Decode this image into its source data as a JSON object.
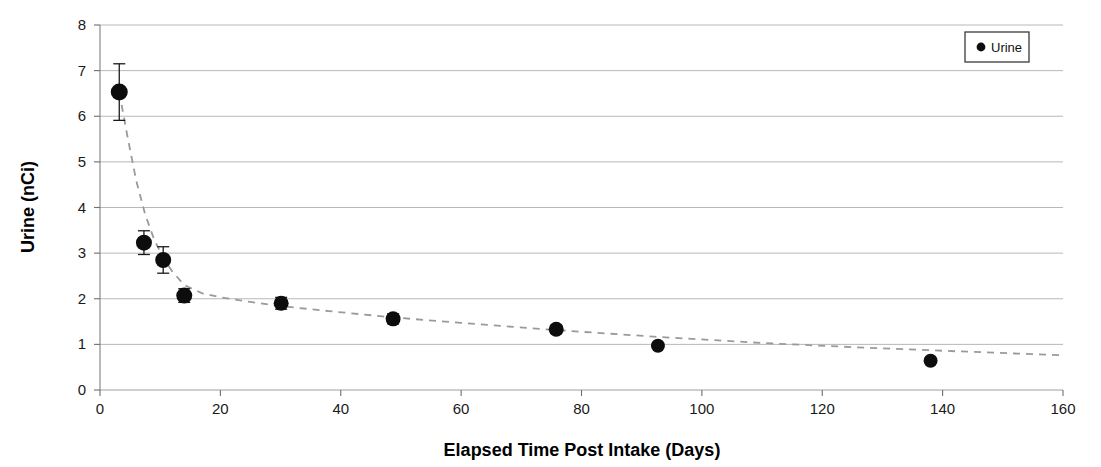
{
  "chart_data": {
    "type": "scatter",
    "title": "",
    "xlabel": "Elapsed Time Post Intake (Days)",
    "ylabel": "Urine  (nCi)",
    "xlim": [
      0,
      160
    ],
    "ylim": [
      0,
      8
    ],
    "xticks": [
      0,
      20,
      40,
      60,
      80,
      100,
      120,
      140,
      160
    ],
    "yticks": [
      0,
      1,
      2,
      3,
      4,
      5,
      6,
      7,
      8
    ],
    "xtick_labels": [
      "0",
      "20",
      "40",
      "60",
      "80",
      "100",
      "120",
      "140",
      "160"
    ],
    "ytick_labels": [
      "0",
      "1",
      "2",
      "3",
      "4",
      "5",
      "6",
      "7",
      "8"
    ],
    "grid": "horizontal",
    "grid_color": "#b0b0b0",
    "legend": {
      "position": "top-right",
      "entries": [
        {
          "name": "Urine",
          "marker": "filled-circle",
          "color": "#0d0d0d"
        }
      ]
    },
    "series": [
      {
        "name": "Urine",
        "marker": "filled-circle",
        "color": "#0d0d0d",
        "x": [
          3.2,
          7.3,
          10.5,
          14.0,
          30.1,
          48.7,
          75.8,
          92.7,
          138.0
        ],
        "y": [
          6.53,
          3.23,
          2.85,
          2.07,
          1.9,
          1.56,
          1.33,
          0.97,
          0.64
        ],
        "yerr": [
          0.62,
          0.26,
          0.29,
          0.15,
          0.13,
          0.11,
          0.09,
          0.05,
          0.04
        ]
      }
    ],
    "trendline": {
      "style": "dashed",
      "color": "#9a9a9a",
      "x": [
        3.2,
        4.5,
        6.0,
        7.5,
        9.0,
        10.5,
        12.0,
        14.0,
        17.0,
        20.0,
        25.0,
        30.0,
        38.0,
        48.0,
        60.0,
        75.0,
        92.0,
        110.0,
        125.0,
        140.0,
        152.0,
        160.0
      ],
      "y": [
        6.53,
        5.6,
        4.6,
        3.85,
        3.3,
        2.9,
        2.6,
        2.3,
        2.12,
        2.03,
        1.93,
        1.84,
        1.73,
        1.6,
        1.47,
        1.32,
        1.17,
        1.03,
        0.94,
        0.86,
        0.8,
        0.76
      ]
    }
  },
  "axes": {
    "y_axis_title": "Urine  (nCi)",
    "x_axis_title": "Elapsed Time Post Intake (Days)"
  },
  "legend": {
    "urine_label": "Urine"
  }
}
